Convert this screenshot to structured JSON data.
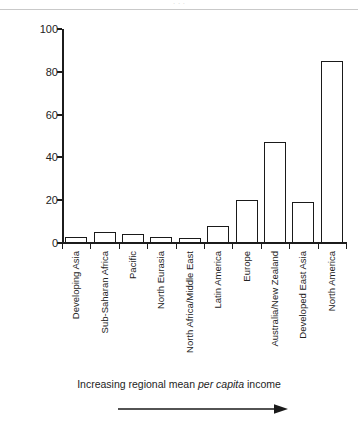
{
  "figure": {
    "top_clipped_text": "· · ·",
    "caption_pre": "Increasing regional mean ",
    "caption_italic": "per capita",
    "caption_post": " income",
    "arrow_icon": "right-arrow-icon"
  },
  "chart_data": {
    "type": "bar",
    "title": "",
    "xlabel": "Increasing regional mean per capita income",
    "ylabel": "% overall conservation cost currently met",
    "categories": [
      "Developing Asia",
      "Sub-Saharan Africa",
      "Pacific",
      "North Eurasia",
      "North Africa/Middle East",
      "Latin America",
      "Europe",
      "Australia/New Zealand",
      "Developed East Asia",
      "North America"
    ],
    "values": [
      3,
      5,
      4,
      3,
      2.5,
      8,
      20,
      47,
      19,
      85
    ],
    "ylim": [
      0,
      100
    ],
    "yticks": [
      0,
      20,
      40,
      60,
      80,
      100
    ],
    "ytick_labels": [
      "0",
      "20",
      "40",
      "60",
      "80",
      "100"
    ],
    "grid": false,
    "legend": false,
    "bar_edge_color": "#1a1a1a",
    "bar_fill_color": "#ffffff",
    "axis_color": "#1c1c1c"
  }
}
